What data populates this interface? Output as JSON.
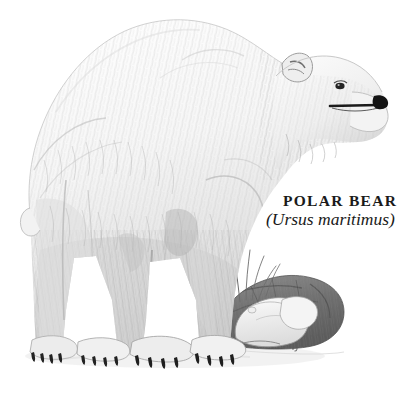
{
  "plate": {
    "subject": "polar bear",
    "medium": "graphite pencil natural-history illustration",
    "background_color": "#ffffff",
    "ink_color": "#1a1a1a",
    "edge_rule_color": "#e9e9e9"
  },
  "caption": {
    "common_name": "POLAR BEAR",
    "scientific_name": "(Ursus maritimus)"
  },
  "scene": {
    "animal_pose": "standing in profile facing right",
    "ground_elements": [
      "rock outcrop",
      "seal carcass",
      "grass blades",
      "snow"
    ],
    "signature_mark": "artist monogram"
  },
  "palette": {
    "fur_light": "#fbfbfb",
    "fur_mid": "#d8d8d8",
    "fur_shadow": "#a9a9a9",
    "fur_deep": "#7c7c7c",
    "claw": "#2b2b2b",
    "nose": "#151515",
    "rock_dark": "#6e6e6e",
    "rock_mid": "#9b9b9b",
    "seal_light": "#f2f2f2"
  }
}
